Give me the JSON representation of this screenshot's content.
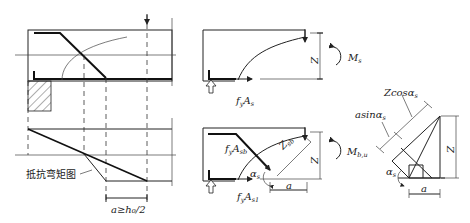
{
  "diagram": {
    "title": "",
    "left_panel": {
      "label_moment_diagram": "抵抗弯矩图",
      "dimension_label": "a≥h₀/2"
    },
    "top_middle_panel": {
      "force_label_main": "f",
      "force_label_main_sub": "y",
      "force_label_main_A": "A",
      "force_label_main_A_sub": "s",
      "lever_arm_label": "Z",
      "moment_label": "M",
      "moment_label_sub": "s"
    },
    "bottom_middle_panel": {
      "force_bent_label": "f",
      "force_bent_sub": "y",
      "force_bent_A": "A",
      "force_bent_A_sub": "sb",
      "force_straight_label": "f",
      "force_straight_sub": "y",
      "force_straight_A": "A",
      "force_straight_A_sub": "s1",
      "lever_arm_bent_label": "Z",
      "lever_arm_bent_sub": "sb",
      "lever_arm_label": "Z",
      "angle_label": "α",
      "angle_sub": "s",
      "offset_label": "a",
      "moment_label": "M",
      "moment_label_sub": "b,u"
    },
    "right_panel": {
      "z_cos_label": "Zcosα",
      "z_cos_sub": "s",
      "a_sin_label": "asinα",
      "a_sin_sub": "s",
      "height_label": "Z",
      "angle_label": "α",
      "angle_sub": "s",
      "base_label": "a"
    }
  }
}
